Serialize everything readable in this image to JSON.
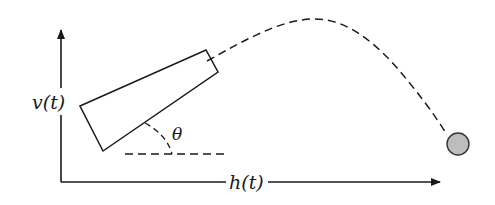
{
  "diagram": {
    "type": "projectile-motion",
    "labels": {
      "vertical_axis": "v(t)",
      "horizontal_axis": "h(t)",
      "angle": "θ"
    },
    "elements": {
      "cannon": "launcher tilted at angle θ",
      "trajectory": "dashed parabolic path",
      "projectile": "gray ball at landing point",
      "reference_line": "dashed horizontal line"
    },
    "colors": {
      "stroke": "#1a1a1a",
      "ball_fill": "#bdbdbd",
      "background": "#ffffff"
    }
  }
}
